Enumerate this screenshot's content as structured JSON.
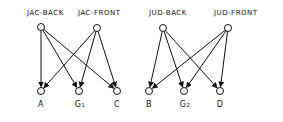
{
  "diagram": {
    "type": "bipartite-graph",
    "top_nodes": [
      {
        "id": "jac-back",
        "label": "JAC-BACK",
        "x": 41,
        "y": 27
      },
      {
        "id": "jac-front",
        "label": "JAC-FRONT",
        "x": 97,
        "y": 28
      },
      {
        "id": "jud-back",
        "label": "JUD-BACK",
        "x": 163,
        "y": 28
      },
      {
        "id": "jud-front",
        "label": "JUD-FRONT",
        "x": 228,
        "y": 28
      }
    ],
    "bottom_nodes": [
      {
        "id": "a",
        "label": "A",
        "x": 41,
        "y": 91
      },
      {
        "id": "g1",
        "label": "G₁",
        "x": 79,
        "y": 91
      },
      {
        "id": "c",
        "label": "C",
        "x": 117,
        "y": 91
      },
      {
        "id": "b",
        "label": "B",
        "x": 149,
        "y": 91
      },
      {
        "id": "g2",
        "label": "G₂",
        "x": 184,
        "y": 91
      },
      {
        "id": "d",
        "label": "D",
        "x": 220,
        "y": 91
      }
    ],
    "edges": [
      {
        "from": "jac-back",
        "to": "a"
      },
      {
        "from": "jac-back",
        "to": "g1"
      },
      {
        "from": "jac-back",
        "to": "c"
      },
      {
        "from": "jac-front",
        "to": "a"
      },
      {
        "from": "jac-front",
        "to": "g1"
      },
      {
        "from": "jac-front",
        "to": "c"
      },
      {
        "from": "jud-back",
        "to": "b"
      },
      {
        "from": "jud-back",
        "to": "g2"
      },
      {
        "from": "jud-back",
        "to": "d"
      },
      {
        "from": "jud-front",
        "to": "b"
      },
      {
        "from": "jud-front",
        "to": "g2"
      },
      {
        "from": "jud-front",
        "to": "d"
      }
    ]
  },
  "labels": {
    "jac_back": "JAC-BACK",
    "jac_front": "JAC-FRONT",
    "jud_back": "JUD-BACK",
    "jud_front": "JUD-FRONT",
    "a": "A",
    "g1": "G₁",
    "c": "C",
    "b": "B",
    "g2": "G₂",
    "d": "D"
  }
}
